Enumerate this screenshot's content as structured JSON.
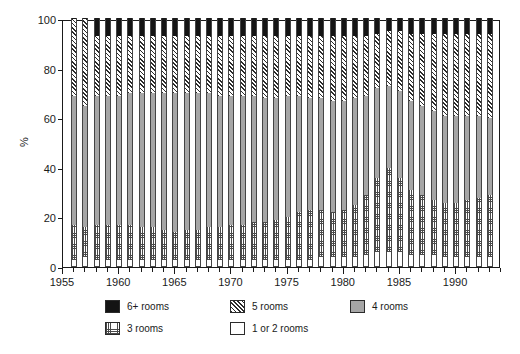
{
  "chart_data": {
    "type": "bar",
    "subtype": "stacked-bar-100-percent",
    "title": "",
    "subtitle": "",
    "xlabel": "",
    "ylabel": "%",
    "ylim": [
      0,
      100
    ],
    "yticks": [
      0,
      20,
      40,
      60,
      80,
      100
    ],
    "ytick_labels": [
      "0",
      "20",
      "40",
      "60",
      "80",
      "100"
    ],
    "xlim": [
      1955,
      1994
    ],
    "xticks": [
      1955,
      1960,
      1965,
      1970,
      1975,
      1980,
      1985,
      1990
    ],
    "xtick_labels": [
      "1955",
      "1960",
      "1965",
      "1970",
      "1975",
      "1980",
      "1985",
      "1990"
    ],
    "x_minor_tick_interval": 1,
    "grid": false,
    "legend_position": "bottom",
    "stack_order_bottom_to_top": [
      "1 or 2 rooms",
      "3 rooms",
      "4 rooms",
      "5 rooms",
      "6+ rooms"
    ],
    "categories": [
      "1956",
      "1957",
      "1958",
      "1959",
      "1960",
      "1961",
      "1962",
      "1963",
      "1964",
      "1965",
      "1966",
      "1967",
      "1968",
      "1969",
      "1970",
      "1971",
      "1972",
      "1973",
      "1974",
      "1975",
      "1976",
      "1977",
      "1978",
      "1979",
      "1980",
      "1981",
      "1982",
      "1983",
      "1984",
      "1985",
      "1986",
      "1987",
      "1988",
      "1989",
      "1990",
      "1991",
      "1992",
      "1993"
    ],
    "series": [
      {
        "name": "1 or 2 rooms",
        "fill": "white",
        "color": "#ffffff",
        "values": [
          3,
          4,
          3,
          3,
          3,
          3,
          3,
          3,
          3,
          3,
          3,
          3,
          3,
          3,
          3,
          3,
          3,
          3,
          3,
          3,
          3,
          3,
          4,
          4,
          4,
          4,
          5,
          6,
          6,
          6,
          5,
          5,
          5,
          4,
          4,
          4,
          4,
          4
        ]
      },
      {
        "name": "3 rooms",
        "fill": "stipple",
        "color": "#ffffff",
        "values": [
          14,
          12,
          14,
          14,
          14,
          14,
          13,
          13,
          12,
          11,
          12,
          12,
          13,
          13,
          14,
          14,
          15,
          15,
          16,
          17,
          19,
          20,
          19,
          18,
          19,
          21,
          24,
          30,
          34,
          30,
          26,
          24,
          22,
          22,
          22,
          23,
          24,
          25
        ]
      },
      {
        "name": "4 rooms",
        "fill": "gray",
        "color": "#a6a6a6",
        "values": [
          52,
          49,
          52,
          52,
          52,
          53,
          54,
          54,
          55,
          56,
          55,
          55,
          54,
          53,
          52,
          52,
          51,
          50,
          49,
          49,
          47,
          45,
          45,
          45,
          44,
          43,
          40,
          36,
          33,
          35,
          36,
          36,
          36,
          35,
          35,
          34,
          33,
          31
        ]
      },
      {
        "name": "5 rooms",
        "fill": "hatch",
        "color": "#ffffff",
        "values": [
          31,
          35,
          24,
          24,
          24,
          23,
          23,
          23,
          23,
          23,
          23,
          23,
          23,
          24,
          24,
          24,
          24,
          25,
          25,
          24,
          24,
          25,
          25,
          26,
          26,
          25,
          24,
          22,
          22,
          24,
          27,
          29,
          31,
          33,
          33,
          33,
          33,
          34
        ]
      },
      {
        "name": "6+ rooms",
        "fill": "black",
        "color": "#141414",
        "values": [
          0,
          0,
          7,
          7,
          7,
          7,
          7,
          7,
          7,
          7,
          7,
          7,
          7,
          7,
          7,
          7,
          7,
          7,
          7,
          7,
          7,
          7,
          7,
          7,
          7,
          7,
          7,
          6,
          5,
          5,
          6,
          6,
          6,
          6,
          6,
          6,
          6,
          6
        ]
      }
    ]
  },
  "legend": {
    "items": [
      {
        "label": "6+ rooms",
        "fill": "black"
      },
      {
        "label": "5 rooms",
        "fill": "hatch"
      },
      {
        "label": "4 rooms",
        "fill": "gray"
      },
      {
        "label": "3 rooms",
        "fill": "dots"
      },
      {
        "label": "1 or 2 rooms",
        "fill": "white"
      }
    ]
  },
  "colors": {
    "axis": "#1a1a1a",
    "gray_fill": "#a6a6a6",
    "black_fill": "#141414",
    "hatch_line": "#2b2b2b",
    "background": "#ffffff"
  }
}
